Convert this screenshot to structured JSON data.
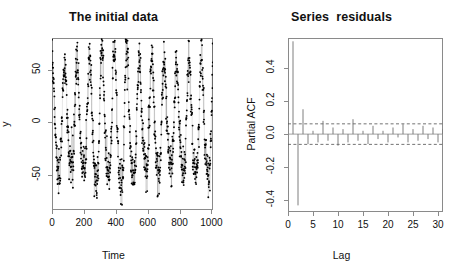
{
  "figure": {
    "width": 455,
    "height": 269,
    "background": "#ffffff",
    "axis_color": "#8a8a8a",
    "data_color": "#000000",
    "panels": 2
  },
  "chart_data": [
    {
      "type": "scatter",
      "panel": "left",
      "title": "The initial data",
      "xlabel": "Time",
      "ylabel": "y",
      "xlim": [
        0,
        1010
      ],
      "ylim": [
        -83,
        80
      ],
      "xticks": [
        0,
        200,
        400,
        600,
        800,
        1000
      ],
      "xtick_labels": [
        "0",
        "200",
        "400",
        "600",
        "800",
        "1000"
      ],
      "yticks": [
        -50,
        0,
        50
      ],
      "ytick_labels": [
        "-50",
        "0",
        "50"
      ],
      "grid": false,
      "legend": "none",
      "n_points": 1000,
      "description": "Dense noisy time-series of 1000 observations with strong periodic/seasonal oscillation; points plotted as small dots joined by faint lines. Values range roughly -83 to 78 with amplitude envelope varying over time.",
      "series": [
        {
          "name": "y",
          "marker": "point",
          "envelope_peaks_x": [
            30,
            120,
            200,
            280,
            350,
            430,
            500,
            570,
            660,
            740,
            820,
            900,
            980
          ],
          "envelope_amplitude": [
            55,
            50,
            52,
            68,
            58,
            72,
            62,
            45,
            60,
            48,
            52,
            58,
            62
          ],
          "period": 78,
          "noise_sd": 11,
          "mean_level": -2
        }
      ]
    },
    {
      "type": "bar",
      "panel": "right",
      "title": "Series  residuals",
      "xlabel": "Lag",
      "ylabel": "Partial ACF",
      "xlim": [
        0,
        31
      ],
      "ylim": [
        -0.47,
        0.58
      ],
      "xticks": [
        0,
        5,
        10,
        15,
        20,
        25,
        30
      ],
      "xtick_labels": [
        "0",
        "5",
        "10",
        "15",
        "20",
        "25",
        "30"
      ],
      "yticks": [
        -0.4,
        -0.2,
        0.0,
        0.2,
        0.4
      ],
      "ytick_labels": [
        "-0.4",
        "-0.2",
        "0.0",
        "0.2",
        "0.4"
      ],
      "grid": false,
      "legend": "none",
      "confidence_bounds": [
        0.062,
        -0.062
      ],
      "confidence_style": "dashed",
      "zero_line": 0.0,
      "categories": [
        1,
        2,
        3,
        4,
        5,
        6,
        7,
        8,
        9,
        10,
        11,
        12,
        13,
        14,
        15,
        16,
        17,
        18,
        19,
        20,
        21,
        22,
        23,
        24,
        25,
        26,
        27,
        28,
        29,
        30,
        31
      ],
      "values": [
        0.56,
        -0.43,
        0.15,
        -0.06,
        0.02,
        -0.05,
        0.08,
        -0.04,
        0.04,
        -0.07,
        0.03,
        -0.05,
        0.09,
        -0.04,
        0.02,
        -0.06,
        0.05,
        -0.03,
        0.02,
        -0.05,
        0.04,
        -0.02,
        0.06,
        -0.05,
        0.03,
        -0.04,
        0.05,
        -0.03,
        0.04,
        -0.05,
        0.03
      ]
    }
  ]
}
